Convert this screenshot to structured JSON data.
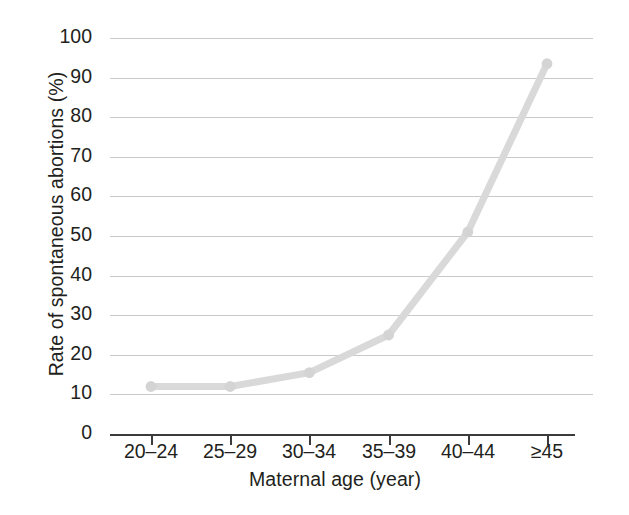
{
  "chart_data": {
    "type": "line",
    "title": "",
    "xlabel": "Maternal age (year)",
    "ylabel": "Rate of spontaneous abortions (%)",
    "categories": [
      "20–24",
      "25–29",
      "30–34",
      "35–39",
      "40–44",
      "≥45"
    ],
    "values": [
      12,
      12,
      15.5,
      25,
      51,
      93.5
    ],
    "series": [
      {
        "name": "Rate of spontaneous abortions",
        "values": [
          12,
          12,
          15.5,
          25,
          51,
          93.5
        ]
      }
    ],
    "ylim": [
      0,
      100
    ],
    "ytick_labels": [
      "0",
      "10",
      "20",
      "30",
      "40",
      "50",
      "60",
      "70",
      "80",
      "90",
      "100"
    ],
    "ytick_values": [
      0,
      10,
      20,
      30,
      40,
      50,
      60,
      70,
      80,
      90,
      100
    ],
    "grid": true,
    "legend": false,
    "legend_position": "none",
    "colors": {
      "line": "#d9d9d9",
      "marker": "#d4d4d4",
      "gridline": "#c9c9c9",
      "axis": "#3b3b3b",
      "text": "#231f20",
      "background": "#ffffff"
    }
  }
}
